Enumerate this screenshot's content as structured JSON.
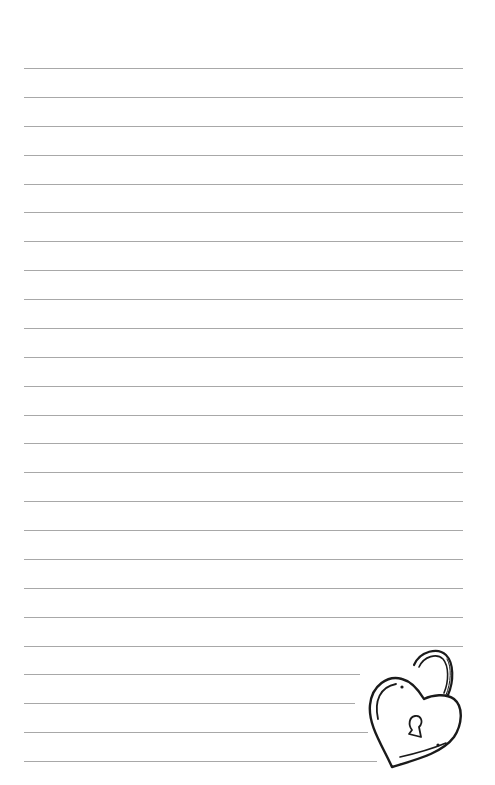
{
  "page": {
    "type": "lined-notebook-page",
    "background_color": "#ffffff",
    "line_color": "#a8a8a8",
    "line_count": 25,
    "first_line_y": 68,
    "line_spacing": 28.875,
    "line_left": 24,
    "line_right": 463,
    "truncated_line_ends": [
      360,
      355,
      368,
      377
    ]
  },
  "illustration": {
    "icon": "heart-padlock-icon",
    "stroke_color": "#1a1a1a"
  }
}
